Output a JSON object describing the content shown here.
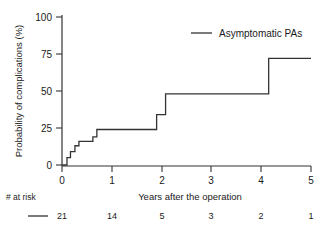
{
  "chart_data": {
    "type": "line",
    "title": "",
    "subtitle": "",
    "xlabel": "Years after the operation",
    "ylabel": "Probability of complications (%)",
    "xlim": [
      0,
      5
    ],
    "ylim": [
      0,
      100
    ],
    "xticks": [
      "0",
      "1",
      "2",
      "3",
      "4",
      "5"
    ],
    "xtick_values": [
      0,
      1,
      2,
      3,
      4,
      5
    ],
    "yticks": [
      "0",
      "25",
      "50",
      "75",
      "100"
    ],
    "ytick_values": [
      0,
      25,
      50,
      75,
      100
    ],
    "grid": false,
    "legend_position": "top-right",
    "series": [
      {
        "name": "Asymptomatic PAs",
        "style": "step",
        "color": "#333333",
        "x": [
          0,
          0.1,
          0.1,
          0.17,
          0.17,
          0.26,
          0.26,
          0.34,
          0.34,
          0.45,
          0.45,
          0.62,
          0.62,
          0.7,
          0.7,
          1.9,
          1.9,
          2.08,
          2.08,
          4.15,
          4.15,
          5.0
        ],
        "y": [
          0,
          0,
          5,
          5,
          9,
          9,
          13,
          13,
          16,
          16,
          16,
          16,
          19,
          19,
          24,
          24,
          34,
          34,
          48,
          48,
          72,
          72
        ],
        "step_points": [
          {
            "time": 0.1,
            "value": 5
          },
          {
            "time": 0.17,
            "value": 9
          },
          {
            "time": 0.26,
            "value": 13
          },
          {
            "time": 0.34,
            "value": 16
          },
          {
            "time": 0.62,
            "value": 19
          },
          {
            "time": 0.7,
            "value": 24
          },
          {
            "time": 1.9,
            "value": 34
          },
          {
            "time": 2.08,
            "value": 48
          },
          {
            "time": 4.15,
            "value": 72
          }
        ]
      }
    ],
    "risk_table": {
      "label": "# at risk",
      "series_name": "Asymptomatic PAs",
      "times": [
        0,
        1,
        2,
        3,
        4,
        5
      ],
      "counts": [
        "21",
        "14",
        "5",
        "3",
        "2",
        "1"
      ]
    }
  },
  "legend": {
    "entries": [
      {
        "label": "Asymptomatic PAs",
        "color": "#333333"
      }
    ]
  },
  "axes": {
    "x_title": "Years after the operation",
    "y_title": "Probability of complications (%)"
  },
  "risk": {
    "header": "# at risk",
    "values": [
      "21",
      "14",
      "5",
      "3",
      "2",
      "1"
    ]
  }
}
